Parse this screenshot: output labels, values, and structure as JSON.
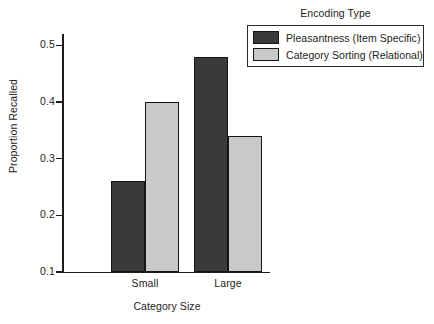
{
  "chart_data": {
    "type": "bar",
    "title": "",
    "xlabel": "Category Size",
    "ylabel": "Proportion Recalled",
    "categories": [
      "Small",
      "Large"
    ],
    "series": [
      {
        "name": "Pleasantness (Item Specific)",
        "values": [
          0.26,
          0.48
        ],
        "color": "#3a3a3a"
      },
      {
        "name": "Category Sorting (Relational)",
        "values": [
          0.4,
          0.34
        ],
        "color": "#c9c9c9"
      }
    ],
    "ylim": [
      0.1,
      0.52
    ],
    "yticks": [
      0.1,
      0.2,
      0.3,
      0.4,
      0.5
    ],
    "ytick_labels": [
      "0.1",
      "0.2",
      "0.3",
      "0.4",
      "0.5"
    ],
    "grid": false,
    "legend_position": "top-right",
    "legend_title": "Encoding Type"
  },
  "axes": {
    "y_title": "Proportion Recalled",
    "x_title": "Category Size",
    "y_ticks": [
      {
        "label": "0.5",
        "value": 0.5
      },
      {
        "label": "0.4",
        "value": 0.4
      },
      {
        "label": "0.3",
        "value": 0.3
      },
      {
        "label": "0.2",
        "value": 0.2
      },
      {
        "label": "0.1",
        "value": 0.1
      }
    ],
    "x_groups": [
      {
        "label": "Small"
      },
      {
        "label": "Large"
      }
    ]
  },
  "legend": {
    "title": "Encoding Type",
    "items": [
      {
        "label": "Pleasantness (Item Specific)",
        "swatch": "dark"
      },
      {
        "label": "Category Sorting (Relational)",
        "swatch": "light"
      }
    ]
  }
}
